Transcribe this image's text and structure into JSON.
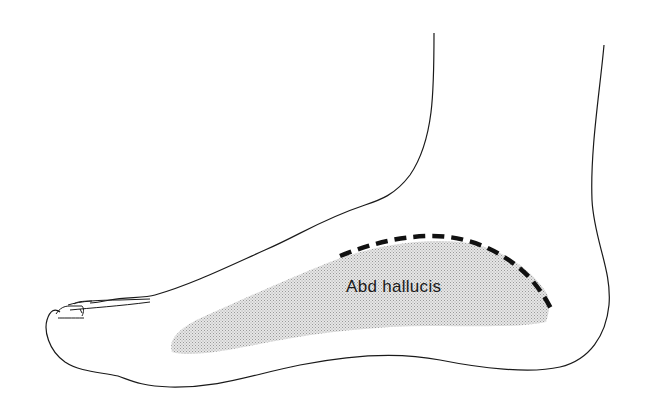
{
  "diagram": {
    "labels": [
      {
        "id": "abd-hallucis",
        "text": "Abd hallucis"
      }
    ],
    "colors": {
      "outline": "#1a1a1a",
      "muscle_fill": "#d4d4d4",
      "dashed_line": "#111111",
      "background": "#ffffff"
    }
  }
}
